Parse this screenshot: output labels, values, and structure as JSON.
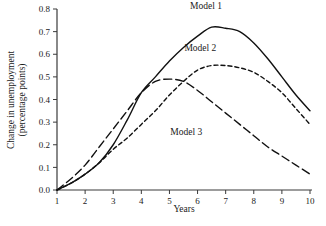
{
  "chart_data": {
    "type": "line",
    "title": "",
    "xlabel": "Years",
    "ylabel": "Change in unemployment (percentage points)",
    "ylabel_line1": "Change in unemployment",
    "ylabel_line2": "(percentage points)",
    "xlim": [
      1,
      10
    ],
    "ylim": [
      0.0,
      0.8
    ],
    "xticks": [
      1,
      2,
      3,
      4,
      5,
      6,
      7,
      8,
      9,
      10
    ],
    "xtick_labels": [
      "1",
      "2",
      "3",
      "4",
      "5",
      "6",
      "7",
      "8",
      "9",
      "10"
    ],
    "yticks": [
      0.0,
      0.1,
      0.2,
      0.3,
      0.4,
      0.5,
      0.6,
      0.7,
      0.8
    ],
    "ytick_labels": [
      "0.0",
      "0.1",
      "0.2",
      "0.3",
      "0.4",
      "0.5",
      "0.6",
      "0.7",
      "0.8"
    ],
    "grid": false,
    "legend_position": "inline-annotations",
    "x": [
      1,
      1.5,
      2,
      2.5,
      3,
      3.5,
      4,
      4.5,
      5,
      5.5,
      6,
      6.5,
      7,
      7.5,
      8,
      8.5,
      9,
      9.5,
      10
    ],
    "series": [
      {
        "name": "Model 1",
        "style": "solid",
        "color": "#111111",
        "values": [
          0.0,
          0.03,
          0.07,
          0.12,
          0.2,
          0.31,
          0.43,
          0.5,
          0.57,
          0.63,
          0.68,
          0.72,
          0.715,
          0.7,
          0.65,
          0.58,
          0.5,
          0.42,
          0.35
        ]
      },
      {
        "name": "Model 2",
        "style": "short-dash",
        "color": "#111111",
        "values": [
          0.0,
          0.03,
          0.07,
          0.12,
          0.18,
          0.23,
          0.29,
          0.35,
          0.42,
          0.48,
          0.53,
          0.55,
          0.55,
          0.54,
          0.52,
          0.48,
          0.43,
          0.36,
          0.29
        ]
      },
      {
        "name": "Model 3",
        "style": "long-dash",
        "color": "#111111",
        "values": [
          0.0,
          0.05,
          0.11,
          0.19,
          0.27,
          0.35,
          0.43,
          0.48,
          0.49,
          0.48,
          0.44,
          0.39,
          0.34,
          0.29,
          0.24,
          0.19,
          0.15,
          0.11,
          0.07
        ]
      }
    ],
    "annotations": [
      {
        "text": "Model 1",
        "x": 6.3,
        "y": 0.8
      },
      {
        "text": "Model 2",
        "x": 6.1,
        "y": 0.615
      },
      {
        "text": "Model 3",
        "x": 5.6,
        "y": 0.245
      }
    ]
  }
}
